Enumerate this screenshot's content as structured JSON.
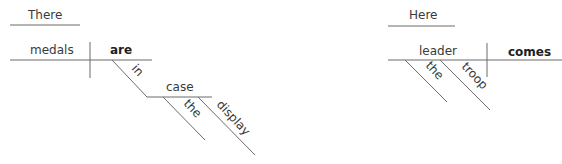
{
  "diagrams": [
    {
      "sentence_words": [
        "There",
        "are",
        "medals",
        "in",
        "the",
        "display",
        "case"
      ],
      "expletive": "There",
      "subject": "medals",
      "verb": "are",
      "preposition": "in",
      "object_of_preposition": "case",
      "modifiers": [
        "the",
        "display"
      ]
    },
    {
      "sentence_words": [
        "Here",
        "comes",
        "the",
        "troop",
        "leader"
      ],
      "expletive": "Here",
      "subject": "leader",
      "verb": "comes",
      "modifiers": [
        "the",
        "troop"
      ]
    }
  ]
}
